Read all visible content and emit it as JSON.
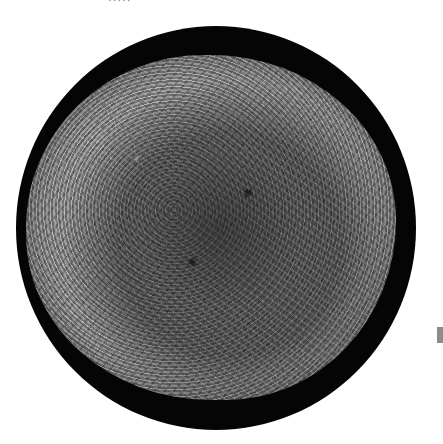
{
  "image": {
    "description": "Scanning electron micrograph of a roughly spherical cell with a ruffled, textured surface inside a black circular field",
    "caption_fragment": "·····",
    "colors": {
      "background": "#ffffff",
      "field": "#050505",
      "cell_surface": "#8a8a8a",
      "marker": "#8c8c8c"
    }
  }
}
